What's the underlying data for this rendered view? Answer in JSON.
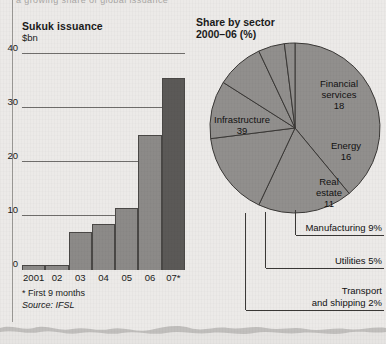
{
  "page": {
    "clipped_top_text": "a growing share of global issuance",
    "background_color": "#eceae8"
  },
  "bar_chart": {
    "title": "Sukuk issuance",
    "subtitle": "$bn",
    "footnote": "* First 9 months",
    "source": "Source: IFSL",
    "colors": {
      "bar": "#8c8a88",
      "bar_highlight": "#5b5957",
      "axis": "#2a2a2a",
      "grid": "#6f6d6b"
    }
  },
  "pie_chart": {
    "title": "Share by sector",
    "subtitle": "2000–06 (%)",
    "colors": {
      "slice": "#918f8d",
      "outline": "#3a3836"
    },
    "inner_labels": [
      {
        "name": "Infrastructure",
        "value": "39"
      },
      {
        "name": "Financial\nservices",
        "value": "18"
      },
      {
        "name": "Energy",
        "value": "16"
      },
      {
        "name": "Real\nestate",
        "value": "11"
      }
    ],
    "callouts": [
      {
        "label": "Manufacturing 9%"
      },
      {
        "label": "Utilities 5%"
      },
      {
        "label": "Transport",
        "label2": "and shipping 2%"
      }
    ]
  },
  "chart_data": [
    {
      "type": "bar",
      "title": "Sukuk issuance",
      "subtitle": "$bn",
      "xlabel": "",
      "ylabel": "$bn",
      "categories": [
        "2001",
        "02",
        "03",
        "04",
        "05",
        "06",
        "07*"
      ],
      "values": [
        1,
        1,
        7,
        8.5,
        11.5,
        25,
        35.5
      ],
      "ylim": [
        0,
        40
      ],
      "yticks": [
        0,
        10,
        20,
        30,
        40
      ],
      "grid": true,
      "legend": "none",
      "highlight_index": 6,
      "footnote": "* First 9 months",
      "source": "Source: IFSL"
    },
    {
      "type": "pie",
      "title": "Share by sector",
      "subtitle": "2000–06 (%)",
      "unit": "%",
      "categories": [
        "Infrastructure",
        "Financial services",
        "Energy",
        "Real estate",
        "Manufacturing",
        "Utilities",
        "Transport and shipping"
      ],
      "values": [
        39,
        18,
        16,
        11,
        9,
        5,
        2
      ],
      "labels_inside": [
        "Infrastructure 39",
        "Financial services 18",
        "Energy 16",
        "Real estate 11"
      ],
      "labels_callout": [
        "Manufacturing 9%",
        "Utilities 5%",
        "Transport and shipping 2%"
      ],
      "legend": "none"
    }
  ]
}
